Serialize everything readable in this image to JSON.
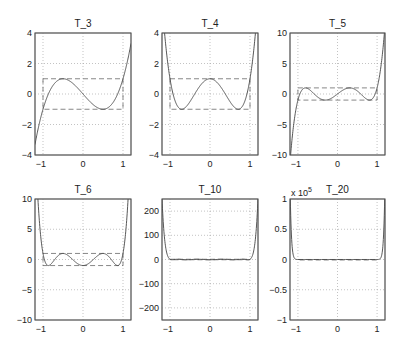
{
  "chart_data": [
    {
      "type": "line",
      "title": "T_3",
      "n": 3,
      "xlim": [
        -1.2,
        1.2
      ],
      "ylim": [
        -4,
        4
      ],
      "xticks": [
        -1,
        0,
        1
      ],
      "yticks": [
        -4,
        -2,
        0,
        2,
        4
      ],
      "ytick_labels": [
        "−4",
        "−2",
        "0",
        "2",
        "4"
      ],
      "grid": true,
      "reference_box": {
        "x": [
          -1,
          1
        ],
        "y": [
          -1,
          1
        ],
        "style": "dashed"
      },
      "multiplier": ""
    },
    {
      "type": "line",
      "title": "T_4",
      "n": 4,
      "xlim": [
        -1.2,
        1.2
      ],
      "ylim": [
        -4,
        4
      ],
      "xticks": [
        -1,
        0,
        1
      ],
      "yticks": [
        -4,
        -2,
        0,
        2,
        4
      ],
      "ytick_labels": [
        "−4",
        "−2",
        "0",
        "2",
        "4"
      ],
      "grid": true,
      "reference_box": {
        "x": [
          -1,
          1
        ],
        "y": [
          -1,
          1
        ],
        "style": "dashed"
      },
      "multiplier": ""
    },
    {
      "type": "line",
      "title": "T_5",
      "n": 5,
      "xlim": [
        -1.2,
        1.2
      ],
      "ylim": [
        -10,
        10
      ],
      "xticks": [
        -1,
        0,
        1
      ],
      "yticks": [
        -10,
        -5,
        0,
        5,
        10
      ],
      "ytick_labels": [
        "−10",
        "−5",
        "0",
        "5",
        "10"
      ],
      "grid": true,
      "reference_box": {
        "x": [
          -1,
          1
        ],
        "y": [
          -1,
          1
        ],
        "style": "dashed"
      },
      "multiplier": ""
    },
    {
      "type": "line",
      "title": "T_6",
      "n": 6,
      "xlim": [
        -1.2,
        1.2
      ],
      "ylim": [
        -10,
        10
      ],
      "xticks": [
        -1,
        0,
        1
      ],
      "yticks": [
        -10,
        -5,
        0,
        5,
        10
      ],
      "ytick_labels": [
        "−10",
        "−5",
        "0",
        "5",
        "10"
      ],
      "grid": true,
      "reference_box": {
        "x": [
          -1,
          1
        ],
        "y": [
          -1,
          1
        ],
        "style": "dashed"
      },
      "multiplier": ""
    },
    {
      "type": "line",
      "title": "T_10",
      "n": 10,
      "xlim": [
        -1.2,
        1.2
      ],
      "ylim": [
        -250,
        250
      ],
      "xticks": [
        -1,
        0,
        1
      ],
      "yticks": [
        -200,
        -100,
        0,
        100,
        200
      ],
      "ytick_labels": [
        "−200",
        "−100",
        "0",
        "100",
        "200"
      ],
      "grid": true,
      "reference_box": {
        "x": [
          -1,
          1
        ],
        "y": [
          -1,
          1
        ],
        "style": "dashed"
      },
      "multiplier": ""
    },
    {
      "type": "line",
      "title": "T_20",
      "n": 20,
      "xlim": [
        -1.2,
        1.2
      ],
      "ylim": [
        -100000,
        100000
      ],
      "xticks": [
        -1,
        0,
        1
      ],
      "yticks": [
        -100000,
        -50000,
        0,
        50000,
        100000
      ],
      "ytick_labels": [
        "−1",
        "−0.5",
        "0",
        "0.5",
        "1"
      ],
      "grid": true,
      "reference_box": {
        "x": [
          -1,
          1
        ],
        "y": [
          -1,
          1
        ],
        "style": "dashed"
      },
      "multiplier": "x 10^5"
    }
  ],
  "layout": {
    "boxes": [
      {
        "x0": 35,
        "x1": 131,
        "y0": 33,
        "y1": 155
      },
      {
        "x0": 162,
        "x1": 258,
        "y0": 33,
        "y1": 155
      },
      {
        "x0": 290,
        "x1": 385,
        "y0": 33,
        "y1": 155
      },
      {
        "x0": 35,
        "x1": 131,
        "y0": 199,
        "y1": 320
      },
      {
        "x0": 162,
        "x1": 258,
        "y0": 199,
        "y1": 320
      },
      {
        "x0": 290,
        "x1": 385,
        "y0": 199,
        "y1": 320
      }
    ]
  }
}
